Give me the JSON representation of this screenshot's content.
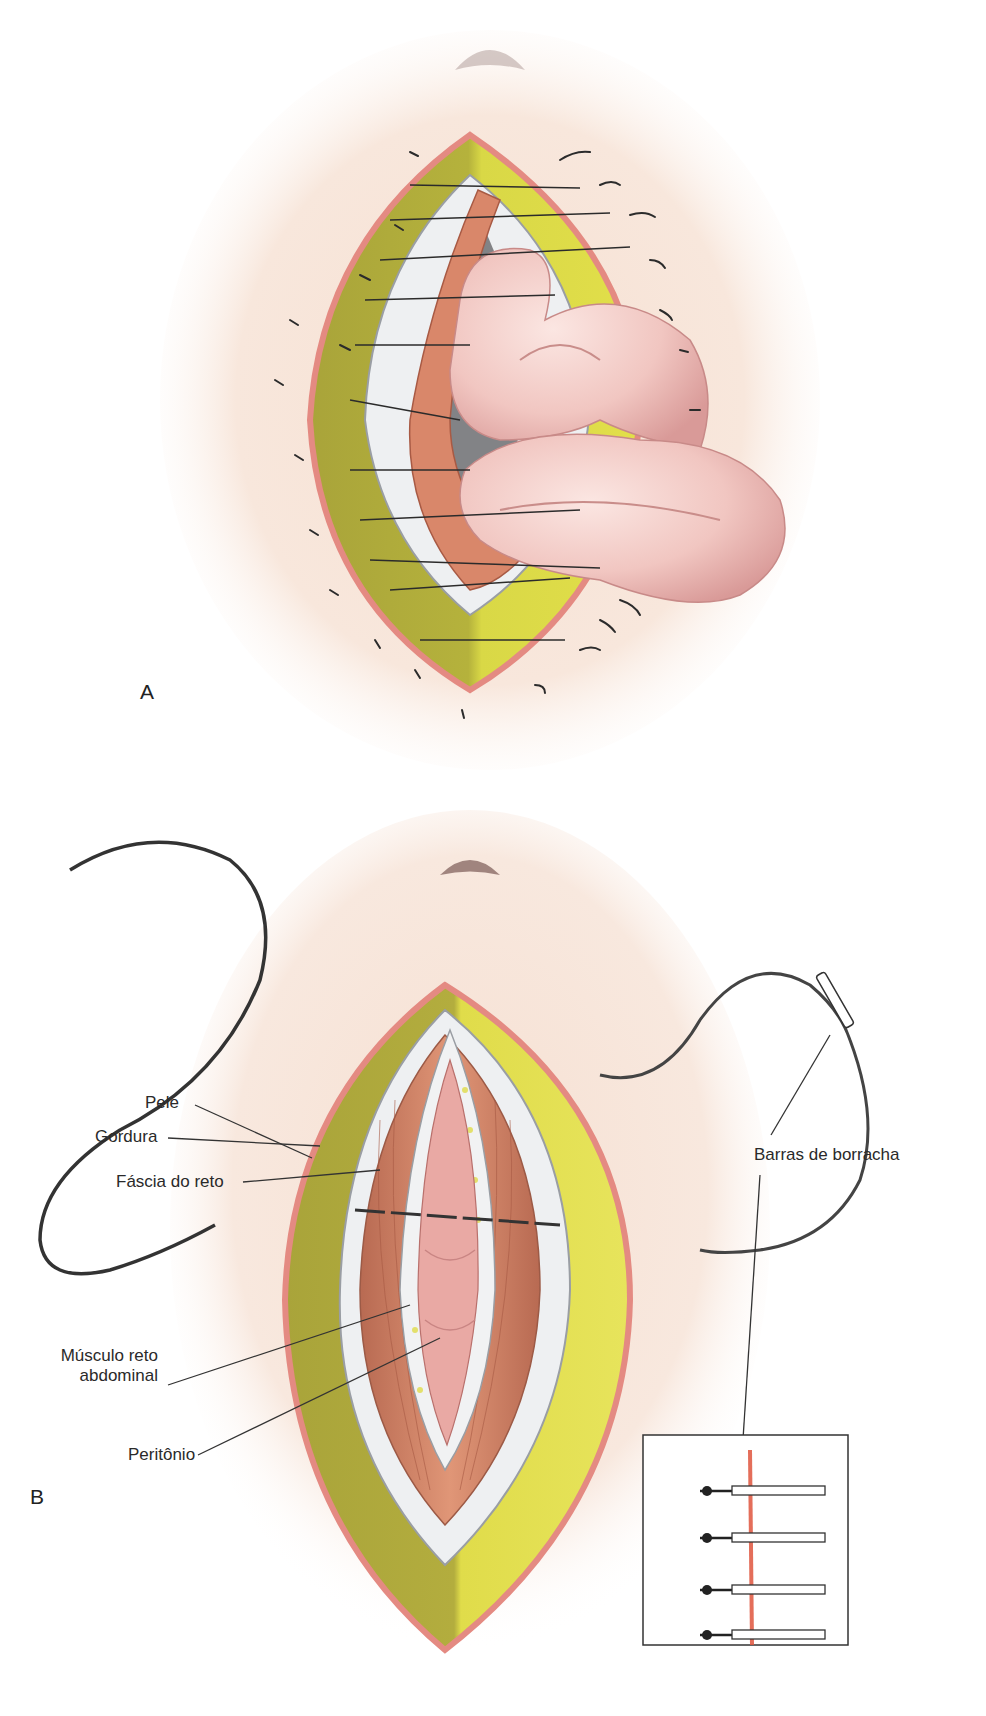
{
  "figure": {
    "panels": [
      {
        "id": "A",
        "letter": "A",
        "description": "Abdominal wound dehiscence with evisceration of bowel loops through open incision; retention sutures in place"
      },
      {
        "id": "B",
        "letter": "B",
        "description": "Closure of abdominal wall layers with retention sutures through rubber bolsters"
      }
    ],
    "labels": {
      "pele": "Pele",
      "gordura": "Gordura",
      "fascia": "Fáscia do reto",
      "musculo_line1": "Músculo reto",
      "musculo_line2": "abdominal",
      "peritonio": "Peritônio",
      "barras": "Barras de borracha"
    },
    "inset": {
      "bolster_count": 4
    },
    "colors": {
      "skin": "#f6e4d8",
      "skin_edge": "#e58a82",
      "fat_dark": "#a9a63a",
      "fat_light": "#e4e14a",
      "fascia": "#eef0f2",
      "muscle": "#d98a6c",
      "bowel": "#f2c9c4",
      "suture": "#2b2b2b",
      "incision": "#e0553e"
    }
  }
}
